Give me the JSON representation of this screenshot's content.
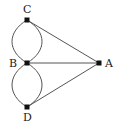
{
  "graph": {
    "nodes": [
      {
        "id": "C",
        "label": "C",
        "x": 27,
        "y": 20
      },
      {
        "id": "B",
        "label": "B",
        "x": 27,
        "y": 63
      },
      {
        "id": "D",
        "label": "D",
        "x": 27,
        "y": 107
      },
      {
        "id": "A",
        "label": "A",
        "x": 99,
        "y": 63
      }
    ],
    "edges": [
      {
        "from": "C",
        "to": "B",
        "style": "curve-left"
      },
      {
        "from": "C",
        "to": "B",
        "style": "curve-right"
      },
      {
        "from": "B",
        "to": "D",
        "style": "curve-left"
      },
      {
        "from": "B",
        "to": "D",
        "style": "curve-right"
      },
      {
        "from": "C",
        "to": "A",
        "style": "straight"
      },
      {
        "from": "B",
        "to": "A",
        "style": "straight"
      },
      {
        "from": "D",
        "to": "A",
        "style": "straight"
      }
    ],
    "colors": {
      "edge": "#555555",
      "node": "#111111"
    }
  }
}
